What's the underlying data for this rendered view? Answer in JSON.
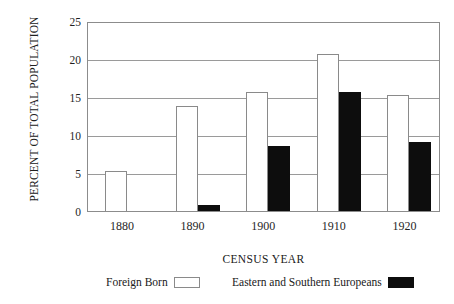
{
  "chart_data": {
    "type": "bar",
    "title": "",
    "xlabel": "CENSUS YEAR",
    "ylabel": "PERCENT OF TOTAL POPULATION",
    "categories": [
      "1880",
      "1890",
      "1900",
      "1910",
      "1920"
    ],
    "yticks": [
      0,
      5,
      10,
      15,
      20,
      25
    ],
    "ytick_labels": [
      "0",
      "5",
      "10",
      "15",
      "20",
      "25"
    ],
    "ylim": [
      0,
      25
    ],
    "grid": true,
    "legend_position": "below",
    "series": [
      {
        "name": "Foreign Born",
        "color": "#ffffff",
        "edge_color": "#8a8a8a",
        "values": [
          5.3,
          13.8,
          15.7,
          20.7,
          15.3
        ]
      },
      {
        "name": "Eastern and Southern Europeans",
        "color": "#0d0d0d",
        "edge_color": "#0d0d0d",
        "values": [
          0.0,
          0.8,
          8.6,
          15.7,
          9.1
        ]
      }
    ]
  },
  "legend": {
    "entries": [
      {
        "label": "Foreign Born",
        "swatch": "hollow-rect-swatch"
      },
      {
        "label": "Eastern and Southern Europeans",
        "swatch": "solid-black-rect-swatch"
      }
    ]
  }
}
